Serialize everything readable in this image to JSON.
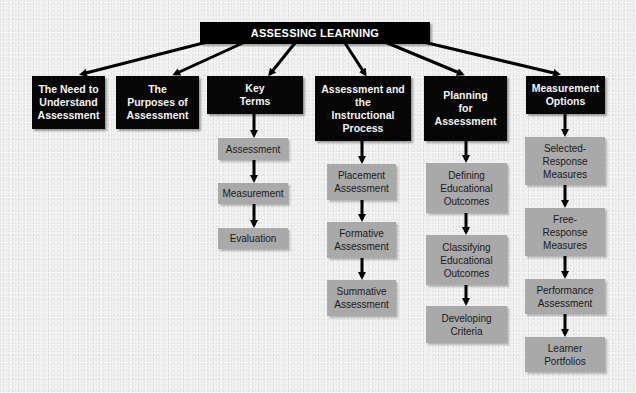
{
  "title": "ASSESSING LEARNING",
  "colors": {
    "background": "#f1f1f1",
    "topic_box": "#060606",
    "topic_text": "#f4f4f4",
    "sub_box": "#a9a9a9",
    "sub_text": "#1a1a1a",
    "connector": "#000000"
  },
  "topics": [
    {
      "label": "The Need to\nUnderstand\nAssessment",
      "children": []
    },
    {
      "label": "The\nPurposes of\nAssessment",
      "children": []
    },
    {
      "label": "Key\nTerms",
      "children": [
        {
          "label": "Assessment"
        },
        {
          "label": "Measurement"
        },
        {
          "label": "Evaluation"
        }
      ]
    },
    {
      "label": "Assessment and\nthe\nInstructional\nProcess",
      "children": [
        {
          "label": "Placement\nAssessment"
        },
        {
          "label": "Formative\nAssessment"
        },
        {
          "label": "Summative\nAssessment"
        }
      ]
    },
    {
      "label": "Planning\nfor\nAssessment",
      "children": [
        {
          "label": "Defining\nEducational\nOutcomes"
        },
        {
          "label": "Classifying\nEducational\nOutcomes"
        },
        {
          "label": "Developing\nCriteria"
        }
      ]
    },
    {
      "label": "Measurement\nOptions",
      "children": [
        {
          "label": "Selected-\nResponse\nMeasures"
        },
        {
          "label": "Free-\nResponse\nMeasures"
        },
        {
          "label": "Performance\nAssessment"
        },
        {
          "label": "Learner\nPortfolios"
        }
      ]
    }
  ]
}
